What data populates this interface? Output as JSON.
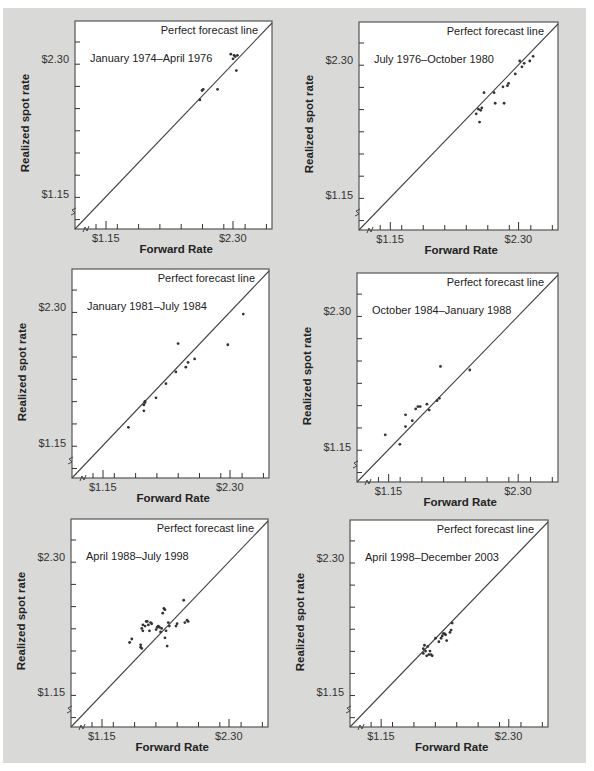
{
  "figure": {
    "background_color": "#d9d9d8",
    "plot_background": "#ffffff",
    "axis_color": "#555555",
    "line_color": "#444444",
    "point_color": "#333333"
  },
  "chart_data": [
    {
      "type": "scatter",
      "title": "January 1974–April 1976",
      "reference_line": "Perfect forecast line",
      "xlabel": "Forward Rate",
      "ylabel": "Realized spot rate",
      "xticks": [
        "$1.15",
        "$2.30"
      ],
      "yticks": [
        "$1.15",
        "$2.30"
      ],
      "points": [
        [
          2.0,
          1.96
        ],
        [
          2.02,
          2.04
        ],
        [
          2.03,
          2.05
        ],
        [
          2.16,
          2.05
        ],
        [
          2.28,
          2.35
        ],
        [
          2.3,
          2.31
        ],
        [
          2.31,
          2.34
        ],
        [
          2.32,
          2.33
        ],
        [
          2.33,
          2.21
        ],
        [
          2.34,
          2.34
        ]
      ]
    },
    {
      "type": "scatter",
      "title": "July 1976–October 1980",
      "reference_line": "Perfect forecast line",
      "xlabel": "Forward Rate",
      "ylabel": "Realized spot rate",
      "xticks": [
        "$1.15",
        "$2.30"
      ],
      "yticks": [
        "$1.15",
        "$2.30"
      ],
      "points": [
        [
          1.92,
          1.85
        ],
        [
          1.94,
          1.89
        ],
        [
          1.96,
          1.88
        ],
        [
          1.97,
          1.9
        ],
        [
          1.95,
          1.78
        ],
        [
          1.99,
          2.03
        ],
        [
          2.08,
          2.03
        ],
        [
          2.09,
          1.94
        ],
        [
          2.16,
          2.08
        ],
        [
          2.17,
          1.94
        ],
        [
          2.2,
          2.09
        ],
        [
          2.21,
          2.11
        ],
        [
          2.27,
          2.19
        ],
        [
          2.31,
          2.3
        ],
        [
          2.33,
          2.25
        ],
        [
          2.35,
          2.28
        ],
        [
          2.4,
          2.3
        ],
        [
          2.43,
          2.34
        ]
      ]
    },
    {
      "type": "scatter",
      "title": "January 1981–July 1984",
      "reference_line": "Perfect forecast line",
      "xlabel": "Forward Rate",
      "ylabel": "Realized spot rate",
      "xticks": [
        "$1.15",
        "$2.30"
      ],
      "yticks": [
        "$1.15",
        "$2.30"
      ],
      "points": [
        [
          1.38,
          1.29
        ],
        [
          1.52,
          1.43
        ],
        [
          1.52,
          1.48
        ],
        [
          1.53,
          1.5
        ],
        [
          1.53,
          1.51
        ],
        [
          1.63,
          1.54
        ],
        [
          1.72,
          1.66
        ],
        [
          1.81,
          1.76
        ],
        [
          1.83,
          2.0
        ],
        [
          1.9,
          1.8
        ],
        [
          1.92,
          1.84
        ],
        [
          1.98,
          1.87
        ],
        [
          2.28,
          1.99
        ],
        [
          2.42,
          2.25
        ]
      ]
    },
    {
      "type": "scatter",
      "title": "October 1984–January 1988",
      "reference_line": "Perfect forecast line",
      "xlabel": "Forward Rate",
      "ylabel": "Realized spot rate",
      "xticks": [
        "$1.15",
        "$2.30"
      ],
      "yticks": [
        "$1.15",
        "$2.30"
      ],
      "points": [
        [
          1.12,
          1.26
        ],
        [
          1.25,
          1.18
        ],
        [
          1.3,
          1.33
        ],
        [
          1.3,
          1.43
        ],
        [
          1.36,
          1.38
        ],
        [
          1.39,
          1.48
        ],
        [
          1.41,
          1.5
        ],
        [
          1.43,
          1.5
        ],
        [
          1.49,
          1.52
        ],
        [
          1.51,
          1.47
        ],
        [
          1.58,
          1.55
        ],
        [
          1.6,
          1.57
        ],
        [
          1.61,
          1.84
        ],
        [
          1.87,
          1.81
        ]
      ]
    },
    {
      "type": "scatter",
      "title": "April 1988–July 1998",
      "reference_line": "Perfect forecast line",
      "xlabel": "Forward Rate",
      "ylabel": "Realized spot rate",
      "xticks": [
        "$1.15",
        "$2.30"
      ],
      "yticks": [
        "$1.15",
        "$2.30"
      ],
      "points": [
        [
          1.4,
          1.58
        ],
        [
          1.42,
          1.61
        ],
        [
          1.5,
          1.54
        ],
        [
          1.5,
          1.56
        ],
        [
          1.51,
          1.53
        ],
        [
          1.51,
          1.7
        ],
        [
          1.52,
          1.68
        ],
        [
          1.52,
          1.73
        ],
        [
          1.54,
          1.72
        ],
        [
          1.55,
          1.76
        ],
        [
          1.56,
          1.76
        ],
        [
          1.57,
          1.73
        ],
        [
          1.58,
          1.68
        ],
        [
          1.59,
          1.75
        ],
        [
          1.6,
          1.74
        ],
        [
          1.64,
          1.69
        ],
        [
          1.65,
          1.71
        ],
        [
          1.66,
          1.72
        ],
        [
          1.67,
          1.71
        ],
        [
          1.68,
          1.67
        ],
        [
          1.69,
          1.7
        ],
        [
          1.7,
          1.83
        ],
        [
          1.71,
          1.87
        ],
        [
          1.72,
          1.86
        ],
        [
          1.72,
          1.62
        ],
        [
          1.73,
          1.68
        ],
        [
          1.74,
          1.55
        ],
        [
          1.75,
          1.75
        ],
        [
          1.76,
          1.72
        ],
        [
          1.82,
          1.72
        ],
        [
          1.83,
          1.74
        ],
        [
          1.89,
          1.94
        ],
        [
          1.9,
          1.75
        ],
        [
          1.92,
          1.77
        ],
        [
          1.93,
          1.76
        ]
      ]
    },
    {
      "type": "scatter",
      "title": "April 1998–December 2003",
      "reference_line": "Perfect forecast line",
      "xlabel": "Forward Rate",
      "ylabel": "Realized spot rate",
      "xticks": [
        "$1.15",
        "$2.30"
      ],
      "yticks": [
        "$1.15",
        "$2.30"
      ],
      "points": [
        [
          1.53,
          1.49
        ],
        [
          1.53,
          1.53
        ],
        [
          1.54,
          1.56
        ],
        [
          1.55,
          1.51
        ],
        [
          1.56,
          1.47
        ],
        [
          1.57,
          1.55
        ],
        [
          1.58,
          1.48
        ],
        [
          1.59,
          1.51
        ],
        [
          1.6,
          1.48
        ],
        [
          1.61,
          1.47
        ],
        [
          1.64,
          1.62
        ],
        [
          1.67,
          1.59
        ],
        [
          1.69,
          1.62
        ],
        [
          1.7,
          1.64
        ],
        [
          1.71,
          1.66
        ],
        [
          1.72,
          1.66
        ],
        [
          1.73,
          1.65
        ],
        [
          1.74,
          1.6
        ],
        [
          1.77,
          1.67
        ],
        [
          1.78,
          1.69
        ],
        [
          1.79,
          1.75
        ]
      ]
    }
  ],
  "panels": [
    {
      "period": "January 1974–April 1976",
      "pfl": "Perfect forecast line",
      "xlabel": "Forward Rate",
      "ylabel": "Realized spot rate",
      "x_lo": "$1.15",
      "x_hi": "$2.30",
      "y_lo": "$1.15",
      "y_hi": "$2.30"
    },
    {
      "period": "July 1976–October 1980",
      "pfl": "Perfect forecast line",
      "xlabel": "Forward Rate",
      "ylabel": "Realized spot rate",
      "x_lo": "$1.15",
      "x_hi": "$2.30",
      "y_lo": "$1.15",
      "y_hi": "$2.30"
    },
    {
      "period": "January 1981–July 1984",
      "pfl": "Perfect forecast line",
      "xlabel": "Forward Rate",
      "ylabel": "Realized spot rate",
      "x_lo": "$1.15",
      "x_hi": "$2.30",
      "y_lo": "$1.15",
      "y_hi": "$2.30"
    },
    {
      "period": "October 1984–January 1988",
      "pfl": "Perfect forecast line",
      "xlabel": "Forward Rate",
      "ylabel": "Realized spot rate",
      "x_lo": "$1.15",
      "x_hi": "$2.30",
      "y_lo": "$1.15",
      "y_hi": "$2.30"
    },
    {
      "period": "April 1988–July 1998",
      "pfl": "Perfect forecast line",
      "xlabel": "Forward Rate",
      "ylabel": "Realized spot rate",
      "x_lo": "$1.15",
      "x_hi": "$2.30",
      "y_lo": "$1.15",
      "y_hi": "$2.30"
    },
    {
      "period": "April 1998–December 2003",
      "pfl": "Perfect forecast line",
      "xlabel": "Forward Rate",
      "ylabel": "Realized spot rate",
      "x_lo": "$1.15",
      "x_hi": "$2.30",
      "y_lo": "$1.15",
      "y_hi": "$2.30"
    }
  ]
}
